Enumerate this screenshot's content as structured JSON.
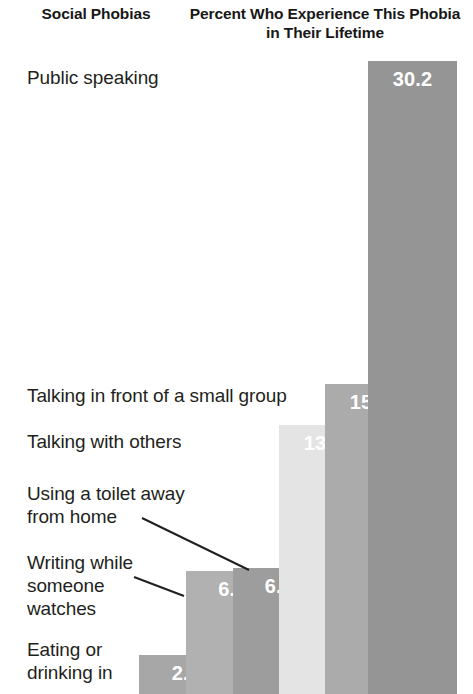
{
  "header": {
    "left": "Social\nPhobias",
    "right": "Percent Who Experience\nThis Phobia in Their Lifetime"
  },
  "chart_data": {
    "type": "bar",
    "title": "Percent Who Experience This Phobia in Their Lifetime",
    "xlabel": "Social Phobias",
    "ylabel": "Percent",
    "grid": false,
    "legend": false,
    "orientation": "vertical-ascending-staircase",
    "ylim": [
      0,
      30.2
    ],
    "categories": [
      "Eating or drinking in",
      "Writing while someone watches",
      "Using a toilet away from home",
      "Talking with others",
      "Talking in front of a small group",
      "Public speaking"
    ],
    "values": [
      2.7,
      6.4,
      6.6,
      13.7,
      15.2,
      30.2
    ],
    "bars": [
      {
        "label": "Eating or drinking in",
        "value": 2.7,
        "value_text": "2.7",
        "color": "#a7a7a7",
        "left": 139,
        "width": 94,
        "top": 655
      },
      {
        "label": "Writing while someone watches",
        "value": 6.4,
        "value_text": "6.4",
        "color": "#b1b1b1",
        "left": 186,
        "width": 93,
        "top": 571
      },
      {
        "label": "Using a toilet away from home",
        "value": 6.6,
        "value_text": "6.6",
        "color": "#9d9d9d",
        "left": 233,
        "width": 92,
        "top": 568
      },
      {
        "label": "Talking with others",
        "value": 13.7,
        "value_text": "13.7",
        "color": "#e4e4e4",
        "left": 279,
        "width": 89,
        "top": 425
      },
      {
        "label": "Talking in front of a small group",
        "value": 15.2,
        "value_text": "15.2",
        "color": "#ababab",
        "left": 325,
        "width": 89,
        "top": 384
      },
      {
        "label": "Public speaking",
        "value": 30.2,
        "value_text": "30.2",
        "color": "#959595",
        "left": 368,
        "width": 89,
        "top": 61
      }
    ],
    "category_labels": [
      {
        "text": "Public speaking",
        "left": 27,
        "top": 66,
        "width": 220
      },
      {
        "text": "Talking in front of a small group",
        "left": 27,
        "top": 384,
        "width": 300
      },
      {
        "text": "Talking with others",
        "left": 27,
        "top": 430,
        "width": 250
      },
      {
        "text": "Using a toilet away\nfrom home",
        "left": 27,
        "top": 482,
        "width": 220
      },
      {
        "text": "Writing while\nsomeone\nwatches",
        "left": 27,
        "top": 551,
        "width": 180
      },
      {
        "text": "Eating or\ndrinking in",
        "left": 27,
        "top": 638,
        "width": 180
      }
    ],
    "leader_lines": [
      {
        "x1": 142,
        "y1": 518,
        "x2": 249,
        "y2": 570,
        "name": "leader-line-toilet"
      },
      {
        "x1": 134,
        "y1": 577,
        "x2": 184,
        "y2": 596,
        "name": "leader-line-writing"
      }
    ],
    "colors": {
      "background": "#ffffff",
      "text": "#231f20",
      "value_text": "#ffffff"
    }
  }
}
